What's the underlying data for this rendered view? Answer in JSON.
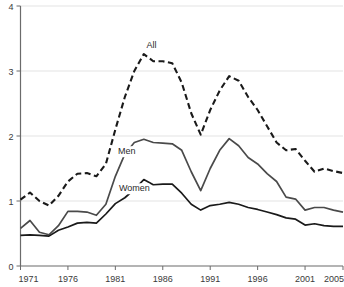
{
  "chart_data": {
    "type": "line",
    "title": "",
    "xlabel": "",
    "ylabel": "",
    "xlim": [
      1971,
      2005
    ],
    "ylim": [
      0,
      4
    ],
    "grid": true,
    "legend_position": "inline-annotations",
    "x_ticks": [
      "1971",
      "1976",
      "1981",
      "1986",
      "1991",
      "1996",
      "2001",
      "2005"
    ],
    "x_tick_values": [
      1971,
      1976,
      1981,
      1986,
      1991,
      1996,
      2001,
      2005
    ],
    "y_ticks": [
      "0",
      "1",
      "2",
      "3",
      "4"
    ],
    "y_tick_values": [
      0,
      1,
      2,
      3,
      4
    ],
    "x": [
      1971,
      1972,
      1973,
      1974,
      1975,
      1976,
      1977,
      1978,
      1979,
      1980,
      1981,
      1982,
      1983,
      1984,
      1985,
      1986,
      1987,
      1988,
      1989,
      1990,
      1991,
      1992,
      1993,
      1994,
      1995,
      1996,
      1997,
      1998,
      1999,
      2000,
      2001,
      2002,
      2003,
      2004,
      2005
    ],
    "series": [
      {
        "name": "All",
        "label": "All",
        "style": "dashed",
        "color": "#1a1a1a",
        "values": [
          1.02,
          1.13,
          1.0,
          0.93,
          1.08,
          1.3,
          1.42,
          1.43,
          1.38,
          1.57,
          2.1,
          2.6,
          3.0,
          3.26,
          3.15,
          3.15,
          3.12,
          2.82,
          2.35,
          2.02,
          2.4,
          2.7,
          2.92,
          2.85,
          2.6,
          2.4,
          2.15,
          1.9,
          1.78,
          1.8,
          1.62,
          1.45,
          1.5,
          1.46,
          1.43
        ],
        "label_x": 1984.8,
        "label_y": 3.36
      },
      {
        "name": "Men",
        "label": "Men",
        "style": "solid",
        "color": "#4a4a4a",
        "values": [
          0.58,
          0.7,
          0.52,
          0.48,
          0.62,
          0.84,
          0.84,
          0.83,
          0.78,
          0.95,
          1.38,
          1.72,
          1.9,
          1.95,
          1.9,
          1.89,
          1.88,
          1.78,
          1.45,
          1.16,
          1.5,
          1.78,
          1.96,
          1.85,
          1.67,
          1.57,
          1.42,
          1.3,
          1.06,
          1.03,
          0.86,
          0.9,
          0.9,
          0.86,
          0.83
        ],
        "label_x": 1982.2,
        "label_y": 1.72
      },
      {
        "name": "Women",
        "label": "Women",
        "style": "solid",
        "color": "#1a1a1a",
        "values": [
          0.47,
          0.48,
          0.47,
          0.46,
          0.55,
          0.6,
          0.66,
          0.67,
          0.66,
          0.8,
          0.96,
          1.05,
          1.18,
          1.33,
          1.25,
          1.26,
          1.26,
          1.12,
          0.95,
          0.86,
          0.93,
          0.95,
          0.98,
          0.95,
          0.9,
          0.87,
          0.83,
          0.79,
          0.74,
          0.72,
          0.63,
          0.65,
          0.62,
          0.61,
          0.61
        ],
        "label_x": 1983.0,
        "label_y": 1.15
      }
    ]
  },
  "colors": {
    "background": "#ffffff",
    "gridline": "#e3e3e3",
    "axis": "#6b6b6b",
    "text": "#3a3a3a"
  }
}
